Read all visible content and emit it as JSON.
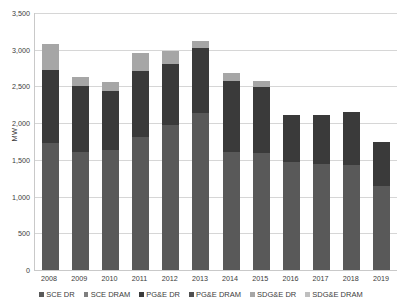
{
  "chart_data": {
    "type": "bar",
    "stacked": true,
    "title": "",
    "xlabel": "",
    "ylabel": "MW",
    "ylim": [
      0,
      3500
    ],
    "ytick_step": 500,
    "ytick_labels": [
      "3,500",
      "3,000",
      "2,500",
      "2,000",
      "1,500",
      "1,000",
      "500",
      "0"
    ],
    "ytick_values": [
      3500,
      3000,
      2500,
      2000,
      1500,
      1000,
      500,
      0
    ],
    "grid": true,
    "legend_position": "bottom",
    "categories": [
      "2008",
      "2009",
      "2010",
      "2011",
      "2012",
      "2013",
      "2014",
      "2015",
      "2016",
      "2017",
      "2018",
      "2019"
    ],
    "series": [
      {
        "name": "SCE DR",
        "color": "#595959",
        "values": [
          1730,
          1610,
          1630,
          1810,
          1980,
          2140,
          1610,
          1600,
          1470,
          1450,
          1430,
          1150
        ]
      },
      {
        "name": "SCE DRAM",
        "color": "#7f7f7f",
        "values": [
          0,
          0,
          0,
          0,
          0,
          0,
          0,
          0,
          0,
          0,
          0,
          0
        ]
      },
      {
        "name": "PG&E DR",
        "color": "#3a3a3a",
        "values": [
          990,
          900,
          810,
          900,
          820,
          880,
          970,
          890,
          640,
          660,
          720,
          600
        ]
      },
      {
        "name": "PG&E DRAM",
        "color": "#4f4f4f",
        "values": [
          0,
          0,
          0,
          0,
          0,
          0,
          0,
          0,
          0,
          0,
          0,
          0
        ]
      },
      {
        "name": "SDG&E DR",
        "color": "#a6a6a6",
        "values": [
          360,
          120,
          120,
          250,
          180,
          100,
          100,
          80,
          0,
          0,
          0,
          0
        ]
      },
      {
        "name": "SDG&E DRAM",
        "color": "#bfbfbf",
        "values": [
          0,
          0,
          0,
          0,
          0,
          0,
          0,
          0,
          0,
          0,
          0,
          0
        ]
      }
    ],
    "totals": [
      3080,
      2630,
      2560,
      2960,
      2980,
      3120,
      2680,
      2570,
      2110,
      2110,
      2150,
      1750
    ]
  }
}
